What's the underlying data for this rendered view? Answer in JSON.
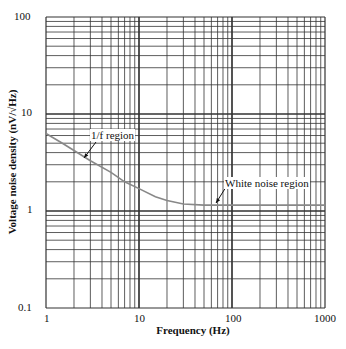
{
  "chart_data": {
    "type": "line",
    "title": "",
    "xlabel": "Frequency (Hz)",
    "ylabel": "Voltage noise density (nV/√Hz)",
    "xscale": "log",
    "yscale": "log",
    "xlim": [
      1,
      1000
    ],
    "ylim": [
      0.1,
      100
    ],
    "grid": true,
    "x_ticks": [
      "1",
      "10",
      "100",
      "1000"
    ],
    "y_ticks": [
      "0.1",
      "1",
      "10",
      "100"
    ],
    "series": [
      {
        "name": "Voltage noise density",
        "x": [
          1,
          1.5,
          2,
          3,
          5,
          7,
          10,
          15,
          20,
          30,
          50,
          70,
          100,
          200,
          500,
          1000
        ],
        "values": [
          6.3,
          5.0,
          4.2,
          3.3,
          2.5,
          2.0,
          1.7,
          1.4,
          1.28,
          1.18,
          1.15,
          1.15,
          1.15,
          1.15,
          1.15,
          1.15
        ]
      }
    ],
    "annotations": [
      {
        "text": "1/f region",
        "x": 2.5,
        "y": 3.6
      },
      {
        "text": "White noise region",
        "x": 60,
        "y": 1.15
      }
    ]
  }
}
